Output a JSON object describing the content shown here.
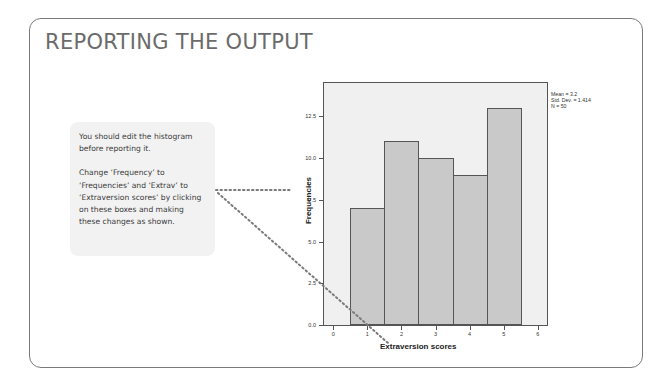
{
  "slide": {
    "title": "REPORTING THE OUTPUT",
    "callout": {
      "paragraphs": [
        "You should edit the histogram before reporting it.",
        "Change ‘Frequency’ to ‘Frequencies’ and ‘Extrav’ to ‘Extraversion scores’ by clicking on these boxes and making these changes as shown."
      ]
    }
  },
  "colors": {
    "card_border": "#7a7a7a",
    "title": "#6b6b6b",
    "callout_bg": "#f2f2f2",
    "plot_bg": "#f0f0f0",
    "bar_fill": "#c9c9c9",
    "dotted_line": "#7a7a7a"
  },
  "chart_data": {
    "type": "bar",
    "title": "",
    "xlabel": "Extraversion scores",
    "ylabel": "Frequencies",
    "categories": [
      "1",
      "2",
      "3",
      "4",
      "5"
    ],
    "values": [
      7,
      11,
      10,
      9,
      13
    ],
    "x_ticks": [
      "0",
      "1",
      "2",
      "3",
      "4",
      "5",
      "6"
    ],
    "y_ticks": [
      "0.0",
      "2.5",
      "5.0",
      "7.5",
      "10.0",
      "12.5"
    ],
    "ylim": [
      0,
      14.5
    ],
    "xlim": [
      -0.3,
      6.3
    ],
    "grid": false,
    "legend": {
      "position": "top-right outside",
      "lines": [
        "Mean = 3.2",
        "Std. Dev. = 1.414",
        "N = 50"
      ]
    }
  }
}
